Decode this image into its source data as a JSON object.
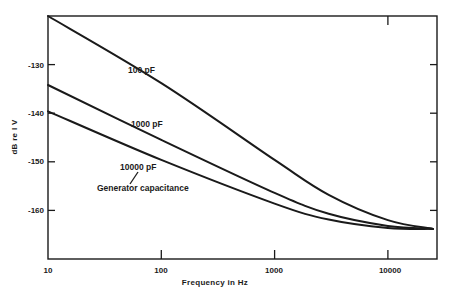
{
  "chart_data": {
    "type": "line",
    "title": "",
    "xlabel": "Frequency in Hz",
    "ylabel": "dB re 1 V",
    "xscale": "log",
    "xlim": [
      10,
      25000
    ],
    "ylim": [
      -170,
      -120
    ],
    "x_ticks": [
      10,
      100,
      1000,
      10000
    ],
    "x_tick_labels": [
      "10",
      "100",
      "1000",
      "10000"
    ],
    "y_ticks": [
      -130,
      -140,
      -150,
      -160
    ],
    "y_tick_labels": [
      "-130",
      "-140",
      "-150",
      "-160"
    ],
    "grid": false,
    "legend": "none (inline curve labels)",
    "annotation": "Generator capacitance",
    "series": [
      {
        "name": "100 pF",
        "x": [
          10,
          100,
          1000,
          3000,
          10000,
          25000
        ],
        "values": [
          -120,
          -133.8,
          -149.6,
          -156.8,
          -162,
          -163.8
        ]
      },
      {
        "name": "1000 pF",
        "x": [
          10,
          100,
          1000,
          3000,
          10000,
          25000
        ],
        "values": [
          -134.2,
          -145.5,
          -156.4,
          -160.7,
          -163.2,
          -163.8
        ]
      },
      {
        "name": "10000 pF",
        "x": [
          10,
          100,
          1000,
          3000,
          10000,
          25000
        ],
        "values": [
          -139.6,
          -149.6,
          -158.6,
          -161.9,
          -163.6,
          -163.8
        ]
      }
    ]
  },
  "labels": {
    "xlabel": "Frequency in Hz",
    "ylabel": "dB re I V",
    "annotation": "Generator capacitance",
    "series_labels": [
      "100 pF",
      "1000 pF",
      "10000 pF"
    ],
    "x_ticks": [
      "10",
      "100",
      "1000",
      "10000"
    ],
    "y_ticks": [
      "-130",
      "-140",
      "-150",
      "-160"
    ]
  },
  "colors": {
    "line": "#1a1a1a",
    "background": "#ffffff"
  }
}
